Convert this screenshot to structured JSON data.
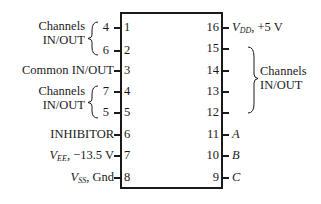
{
  "chip": {
    "left_pins": [
      {
        "num": "1",
        "label": "4",
        "group": "Channels IN/OUT"
      },
      {
        "num": "2",
        "label": "6",
        "group": "Channels IN/OUT"
      },
      {
        "num": "3",
        "label": "Common IN/OUT"
      },
      {
        "num": "4",
        "label": "7",
        "group": "Channels IN/OUT"
      },
      {
        "num": "5",
        "label": "5",
        "group": "Channels IN/OUT"
      },
      {
        "num": "6",
        "label": "INHIBITOR"
      },
      {
        "num": "7",
        "label_main": "V",
        "label_sub": "EE",
        "label_rest": ", −13.5 V"
      },
      {
        "num": "8",
        "label_main": "V",
        "label_sub": "SS",
        "label_rest": ", Gnd"
      }
    ],
    "right_pins": [
      {
        "num": "16",
        "label_main": "V",
        "label_sub": "DD",
        "label_rest": ", +5 V"
      },
      {
        "num": "15",
        "label": ""
      },
      {
        "num": "14",
        "label": ""
      },
      {
        "num": "13",
        "label": ""
      },
      {
        "num": "12",
        "label": ""
      },
      {
        "num": "11",
        "label": "A"
      },
      {
        "num": "10",
        "label": "B"
      },
      {
        "num": "9",
        "label": "C"
      }
    ],
    "groups": {
      "left_top": [
        "Channels",
        "IN/OUT"
      ],
      "left_mid": [
        "Channels",
        "IN/OUT"
      ],
      "right": [
        "Channels",
        "IN/OUT"
      ]
    }
  }
}
